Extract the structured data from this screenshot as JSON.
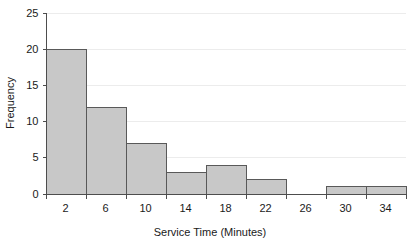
{
  "chart_data": {
    "type": "bar",
    "title": "",
    "xlabel": "Service Time (Minutes)",
    "ylabel": "Frequency",
    "bin_edges": [
      0,
      4,
      8,
      12,
      16,
      20,
      24,
      28,
      32,
      36
    ],
    "bin_width": 4,
    "categories": [
      "0-4",
      "4-8",
      "8-12",
      "12-16",
      "16-20",
      "20-24",
      "24-28",
      "28-32",
      "32-36"
    ],
    "values": [
      20,
      12,
      7,
      3,
      4,
      2,
      0,
      1,
      1
    ],
    "x_tick_labels": [
      "2",
      "6",
      "10",
      "14",
      "18",
      "22",
      "26",
      "30",
      "34"
    ],
    "x_tick_values": [
      2,
      6,
      10,
      14,
      18,
      22,
      26,
      30,
      34
    ],
    "y_tick_labels": [
      "0",
      "5",
      "10",
      "15",
      "20",
      "25"
    ],
    "y_tick_values": [
      0,
      5,
      10,
      15,
      20,
      25
    ],
    "xlim": [
      0,
      36
    ],
    "ylim": [
      0,
      25
    ],
    "grid": true,
    "grid_axis": "y",
    "legend": false,
    "legend_position": "none",
    "colors": {
      "bar_fill": "#c8c8c8",
      "bar_border": "#595959",
      "gridline": "#ececec",
      "axis": "#4d4d4d",
      "text": "#1a1a1a",
      "background": "#ffffff"
    }
  }
}
